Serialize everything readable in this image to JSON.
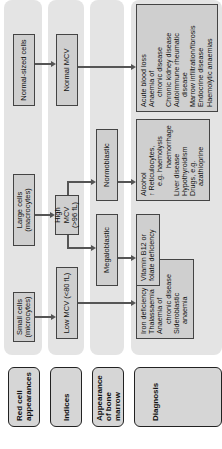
{
  "rows": {
    "red_cell": "Red cell appearances",
    "indices": "Indices",
    "bone_marrow": "Appearance of bone marrow",
    "diagnosis": "Diagnosis"
  },
  "red_cell": {
    "small": "Small cells (microcytes)",
    "large": "Large cells (macrocytes)",
    "normal": "Normal-sized cells"
  },
  "indices": {
    "low": "Low MCV (<80 fL)",
    "high": "High MCV (>96 fL)",
    "normal": "Normal MCV"
  },
  "bone_marrow": {
    "megaloblastic": "Megaloblastic",
    "normoblastic": "Normoblastic"
  },
  "diagnosis": {
    "microcytic": [
      "Iron deficiency",
      "Thalassaemia",
      "Anaemia of",
      "chronic disease",
      "Sideroblastic",
      "anaemia"
    ],
    "megaloblastic": [
      "Vitamin B12 or",
      "folate deficiency"
    ],
    "normoblastic": [
      "Alcohol",
      "↑ Reticulocytes,",
      "e.g. haemolysis",
      "haemorrhage",
      "Liver disease",
      "Hypothyroidism",
      "Drugs, e.g.",
      "azathioprine"
    ],
    "normocytic": [
      "Acute blood loss",
      "Anaemia of",
      "chronic disease",
      "Chronic kidney disease",
      "Autoimmune rheumatic",
      "disease",
      "Marrow infiltration/fibrosis",
      "Endocrine disease",
      "Haemolytic anaemias"
    ]
  }
}
